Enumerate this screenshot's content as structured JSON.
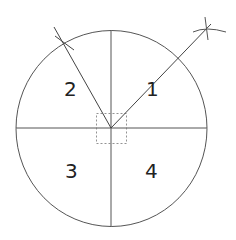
{
  "diagram": {
    "type": "circle-quadrant-construction",
    "center": [
      111.5,
      128.5
    ],
    "radius_x": 95.5,
    "radius_y": 98,
    "line_color": "#444444",
    "labels": [
      {
        "text": "2",
        "x": 70,
        "y": 96
      },
      {
        "text": "1",
        "x": 152,
        "y": 96
      },
      {
        "text": "3",
        "x": 71,
        "y": 178
      },
      {
        "text": "4",
        "x": 151,
        "y": 178
      }
    ],
    "center_box": {
      "x": 96,
      "y": 113,
      "w": 31,
      "h": 30,
      "style": "dashed"
    },
    "rays": [
      {
        "name": "ray-quadrant-2",
        "to": [
          54,
          27
        ]
      },
      {
        "name": "ray-quadrant-1",
        "to": [
          207,
          29
        ]
      }
    ]
  }
}
